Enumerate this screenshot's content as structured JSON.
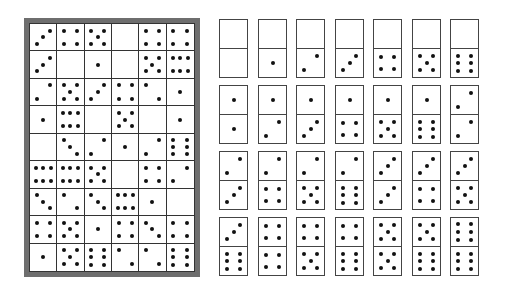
{
  "puzzle": {
    "frame_color": "#6e6e6e",
    "rows": 9,
    "cols": 6,
    "grid": [
      [
        3,
        4,
        5,
        0,
        4,
        4
      ],
      [
        3,
        0,
        1,
        0,
        5,
        6
      ],
      [
        2,
        5,
        3,
        4,
        2,
        1
      ],
      [
        1,
        6,
        0,
        5,
        0,
        1
      ],
      [
        0,
        3,
        2,
        1,
        2,
        6
      ],
      [
        6,
        6,
        5,
        0,
        4,
        2
      ],
      [
        3,
        2,
        3,
        6,
        1,
        0
      ],
      [
        4,
        5,
        1,
        4,
        3,
        4
      ],
      [
        1,
        5,
        6,
        2,
        2,
        6
      ]
    ]
  },
  "domino_set": {
    "rows": [
      [
        [
          0,
          0
        ],
        [
          0,
          1
        ],
        [
          0,
          2
        ],
        [
          0,
          3
        ],
        [
          0,
          4
        ],
        [
          0,
          5
        ],
        [
          0,
          6
        ]
      ],
      [
        [
          1,
          1
        ],
        [
          1,
          2
        ],
        [
          1,
          3
        ],
        [
          1,
          4
        ],
        [
          1,
          5
        ],
        [
          1,
          6
        ],
        [
          2,
          2
        ]
      ],
      [
        [
          2,
          3
        ],
        [
          2,
          4
        ],
        [
          2,
          5
        ],
        [
          2,
          6
        ],
        [
          3,
          3
        ],
        [
          3,
          4
        ],
        [
          3,
          5
        ]
      ],
      [
        [
          3,
          6
        ],
        [
          4,
          4
        ],
        [
          4,
          5
        ],
        [
          4,
          6
        ],
        [
          5,
          5
        ],
        [
          5,
          6
        ],
        [
          6,
          6
        ]
      ]
    ]
  }
}
